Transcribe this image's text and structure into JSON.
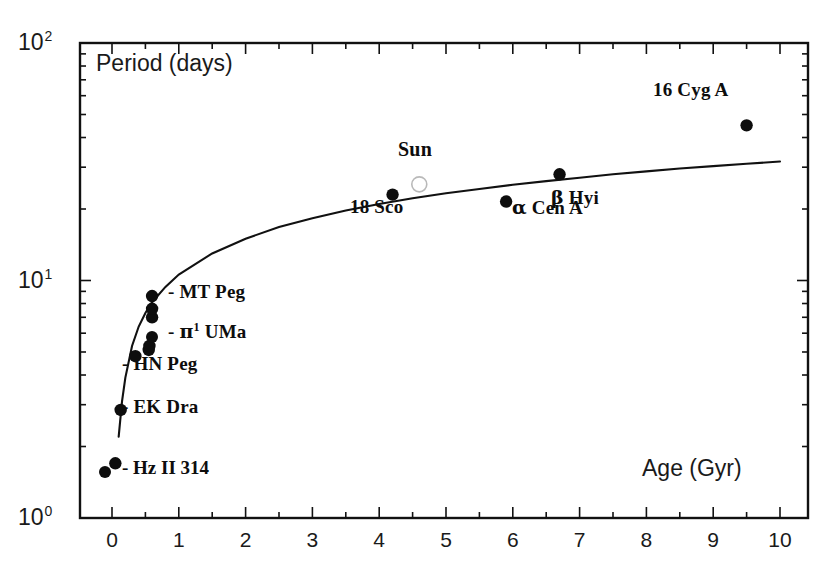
{
  "chart_data": {
    "type": "scatter",
    "title": "",
    "xlabel": "Age (Gyr)",
    "ylabel": "Period (days)",
    "xlim": [
      0,
      10
    ],
    "ylim": [
      1,
      100
    ],
    "yscale": "log",
    "xscale": "linear",
    "grid": false,
    "legend": "none",
    "x_ticks": [
      "0",
      "1",
      "2",
      "3",
      "4",
      "5",
      "6",
      "7",
      "8",
      "9",
      "10"
    ],
    "x_tick_values": [
      0,
      1,
      2,
      3,
      4,
      5,
      6,
      7,
      8,
      9,
      10
    ],
    "y_ticks": [
      "10^0",
      "10^1",
      "10^2"
    ],
    "y_tick_values": [
      1,
      10,
      100
    ],
    "series": [
      {
        "name": "stars",
        "marker": "filled-circle",
        "color": "#0d0d0d",
        "points": [
          {
            "label": "Hz II 314",
            "x": 0.05,
            "y": 1.7,
            "labelled": true,
            "marker": "filled-circle"
          },
          {
            "label": "EK Dra",
            "x": 0.13,
            "y": 2.85,
            "labelled": true,
            "marker": "filled-circle"
          },
          {
            "label": "HN Peg",
            "x": 0.35,
            "y": 4.8,
            "labelled": true,
            "marker": "filled-circle"
          },
          {
            "label": "",
            "x": 0.55,
            "y": 5.1,
            "labelled": false,
            "marker": "filled-circle"
          },
          {
            "label": "pi1 UMa",
            "x": 0.56,
            "y": 5.3,
            "labelled": true,
            "marker": "filled-circle"
          },
          {
            "label": "",
            "x": 0.6,
            "y": 7.0,
            "labelled": false,
            "marker": "filled-circle"
          },
          {
            "label": "",
            "x": 0.6,
            "y": 7.6,
            "labelled": false,
            "marker": "filled-circle"
          },
          {
            "label": "MT Peg",
            "x": 0.6,
            "y": 8.6,
            "labelled": true,
            "marker": "filled-circle"
          },
          {
            "label": "18 Sco",
            "x": 4.2,
            "y": 23.0,
            "labelled": true,
            "marker": "filled-circle"
          },
          {
            "label": "Sun",
            "x": 4.6,
            "y": 25.4,
            "labelled": true,
            "marker": "open-circle"
          },
          {
            "label": "alpha Cen A",
            "x": 5.9,
            "y": 21.5,
            "labelled": true,
            "marker": "filled-circle"
          },
          {
            "label": "beta Hyi",
            "x": 6.7,
            "y": 28.0,
            "labelled": true,
            "marker": "filled-circle"
          },
          {
            "label": "16 Cyg A",
            "x": 9.5,
            "y": 45.0,
            "labelled": true,
            "marker": "filled-circle"
          }
        ]
      }
    ],
    "fit_curve": {
      "name": "rotation-age relation",
      "description": "Period grows roughly as square root of age",
      "x": [
        0.1,
        0.15,
        0.2,
        0.3,
        0.4,
        0.5,
        0.6,
        0.8,
        1.0,
        1.5,
        2.0,
        2.5,
        3.0,
        3.5,
        4.0,
        4.5,
        5.0,
        5.5,
        6.0,
        6.5,
        7.0,
        7.5,
        8.0,
        8.5,
        9.0,
        9.5,
        10.0
      ],
      "y": [
        2.2,
        3.1,
        3.9,
        5.3,
        6.4,
        7.3,
        8.1,
        9.4,
        10.6,
        13.0,
        15.0,
        16.8,
        18.3,
        19.7,
        21.0,
        22.2,
        23.3,
        24.3,
        25.3,
        26.2,
        27.1,
        28.0,
        28.8,
        29.6,
        30.3,
        31.0,
        31.7
      ]
    },
    "point_labels": [
      {
        "text": "MT Peg",
        "prefix": "- ",
        "x_px": 168,
        "y_px": 291
      },
      {
        "text": "UMa",
        "prefix": "- ",
        "x_px": 168,
        "y_px": 330,
        "greek": "π",
        "sup": "1"
      },
      {
        "text": "HN Peg",
        "prefix": "- ",
        "x_px": 122,
        "y_px": 362
      },
      {
        "text": "EK Dra",
        "prefix": "- ",
        "x_px": 122,
        "y_px": 405
      },
      {
        "text": "Hz II 314",
        "prefix": "- ",
        "x_px": 122,
        "y_px": 466
      },
      {
        "text": "18 Sco",
        "x_px": 350,
        "y_px": 205
      },
      {
        "text": "Sun",
        "x_px": 398,
        "y_px": 146
      },
      {
        "text": "Cen A",
        "x_px": 512,
        "y_px": 205,
        "greek": "α"
      },
      {
        "text": "Hyi",
        "x_px": 551,
        "y_px": 195,
        "greek": "β"
      },
      {
        "text": "16 Cyg A",
        "x_px": 655,
        "y_px": 88
      }
    ],
    "legend_markers": [
      {
        "for": "pi1 UMa",
        "x_px": 152,
        "y_px": 337
      },
      {
        "for": "Hz II 314",
        "x_px": 105,
        "y_px": 472
      }
    ],
    "axis_geometry": {
      "left_px": 80,
      "right_px": 808,
      "top_px": 43,
      "bottom_px": 518,
      "x0_px": 112,
      "x10_px": 780,
      "y1_px": 518,
      "y10_px": 281,
      "y100_px": 43
    }
  },
  "axes": {
    "y_label_top": "10",
    "y_label_top_exp": "2",
    "y_label_mid": "10",
    "y_label_mid_exp": "1",
    "y_label_bot": "10",
    "y_label_bot_exp": "0",
    "y_title": "Period (days)",
    "x_title": "Age (Gyr)"
  }
}
